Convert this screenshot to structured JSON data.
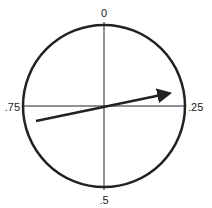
{
  "diagram": {
    "type": "phase-circle",
    "labels": {
      "top": "0",
      "right": ".25",
      "bottom": ".5",
      "left": ".75"
    },
    "arrow": {
      "description": "phase arrow pointing slightly above the .25 direction",
      "from": [
        36,
        121
      ],
      "to": [
        173,
        92
      ]
    },
    "colors": {
      "stroke": "#222222",
      "background": "#ffffff"
    }
  }
}
